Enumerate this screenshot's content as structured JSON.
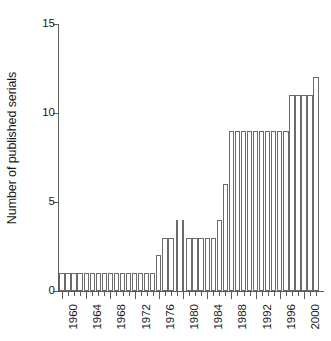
{
  "chart_data": {
    "type": "bar",
    "title": "",
    "xlabel": "",
    "ylabel": "Number of published serials",
    "ylim": [
      0,
      15
    ],
    "yticks": [
      0,
      5,
      10,
      15
    ],
    "ytick_labels": [
      "0",
      "5",
      "10",
      "15"
    ],
    "xlim": [
      1959.5,
      2002.5
    ],
    "grid": false,
    "legend": null,
    "bar_fill_color": "#ffffff",
    "bar_edge_color": "#6b6b6b",
    "axis_color": "#5a5a5a",
    "xtick_labels": [
      "1960",
      "1964",
      "1968",
      "1972",
      "1976",
      "1980",
      "1984",
      "1988",
      "1992",
      "1996",
      "2000"
    ],
    "xtick_label_years": [
      1960,
      1964,
      1968,
      1972,
      1976,
      1980,
      1984,
      1988,
      1992,
      1996,
      2000
    ],
    "categories": [
      "1960",
      "1961",
      "1962",
      "1963",
      "1964",
      "1965",
      "1966",
      "1967",
      "1968",
      "1969",
      "1970",
      "1971",
      "1972",
      "1973",
      "1974",
      "1975",
      "1976",
      "1977",
      "1978",
      "1979",
      "1980",
      "1981",
      "1982",
      "1983",
      "1984",
      "1985",
      "1986",
      "1987",
      "1988",
      "1989",
      "1990",
      "1991",
      "1992",
      "1993",
      "1994",
      "1995",
      "1996",
      "1997",
      "1998",
      "1999",
      "2000",
      "2001",
      "2002"
    ],
    "values": [
      1,
      1,
      1,
      1,
      1,
      1,
      1,
      1,
      1,
      1,
      1,
      1,
      1,
      1,
      1,
      1,
      2,
      3,
      3,
      4,
      4,
      3,
      3,
      3,
      3,
      3,
      4,
      6,
      9,
      9,
      9,
      9,
      9,
      9,
      9,
      9,
      9,
      9,
      11,
      11,
      11,
      11,
      12
    ],
    "narrow_bar_years": [
      1979,
      1980
    ]
  }
}
